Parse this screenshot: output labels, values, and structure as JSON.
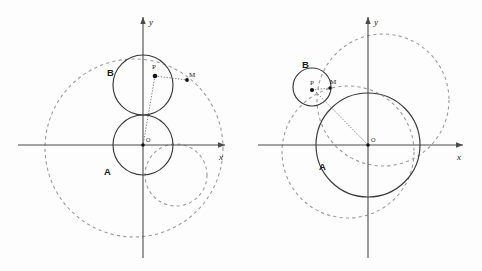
{
  "figure": {
    "background_color": "#fdfdfd",
    "solid_stroke_color": "#3a3a3a",
    "dashed_stroke_color": "#9b9b9b",
    "axis_color": "#4a4a4a",
    "point_color": "#111111"
  },
  "panels": [
    {
      "id": "left",
      "name": "left-diagram",
      "origin": {
        "x": 143,
        "y": 145,
        "label": "O"
      },
      "axes": {
        "x_label": "x",
        "y_label": "y",
        "x_start": 18,
        "x_end": 228,
        "y_top": 14,
        "y_bottom": 258
      },
      "labels": {
        "circle_a": "A",
        "circle_b": "B",
        "point_p": "P",
        "point_m": "M",
        "origin": "O"
      },
      "circles": [
        {
          "name": "circle-A",
          "style": "solid",
          "cx": 143,
          "cy": 145,
          "r": 30
        },
        {
          "name": "circle-B",
          "style": "solid",
          "cx": 143,
          "cy": 85,
          "r": 30
        },
        {
          "name": "dashed-outer",
          "style": "dashed",
          "cx": 134,
          "cy": 148,
          "r": 89
        },
        {
          "name": "dashed-inner-right",
          "style": "dashed",
          "cx": 176,
          "cy": 175,
          "r": 31
        }
      ],
      "points": [
        {
          "name": "point-P",
          "label": "P",
          "x": 155,
          "y": 76,
          "label_dx": 0,
          "label_dy": -5
        },
        {
          "name": "point-M",
          "label": "M",
          "x": 187,
          "y": 80,
          "label_dx": 3,
          "label_dy": -2
        },
        {
          "name": "point-O",
          "label": "O",
          "x": 143,
          "y": 145,
          "label_dx": 3,
          "label_dy": -3
        }
      ],
      "segments": [
        {
          "name": "segment-PM",
          "x1": 155,
          "y1": 76,
          "x2": 187,
          "y2": 80
        },
        {
          "name": "segment-PO",
          "x1": 155,
          "y1": 76,
          "x2": 143,
          "y2": 145
        }
      ],
      "label_positions": {
        "A": {
          "x": 107,
          "y": 172
        },
        "B": {
          "x": 113,
          "y": 73
        }
      }
    },
    {
      "id": "right",
      "name": "right-diagram",
      "origin": {
        "x": 368,
        "y": 145,
        "label": "O"
      },
      "axes": {
        "x_label": "x",
        "y_label": "y",
        "x_start": 258,
        "x_end": 466,
        "y_top": 14,
        "y_bottom": 258
      },
      "labels": {
        "circle_a": "A",
        "circle_b": "B",
        "point_p": "P",
        "point_m": "M",
        "origin": "O"
      },
      "circles": [
        {
          "name": "circle-A",
          "style": "solid",
          "cx": 368,
          "cy": 145,
          "r": 52
        },
        {
          "name": "circle-B",
          "style": "solid",
          "cx": 312,
          "cy": 87,
          "r": 19
        },
        {
          "name": "dashed-upper-right",
          "style": "dashed",
          "cx": 383,
          "cy": 100,
          "r": 66
        },
        {
          "name": "dashed-lower-left",
          "style": "dashed",
          "cx": 348,
          "cy": 152,
          "r": 66
        }
      ],
      "points": [
        {
          "name": "point-P",
          "label": "P",
          "x": 312,
          "y": 90,
          "label_dx": 0,
          "label_dy": -4
        },
        {
          "name": "point-M",
          "label": "M",
          "x": 330,
          "y": 88,
          "label_dx": 2,
          "label_dy": -3
        },
        {
          "name": "point-O",
          "label": "O",
          "x": 368,
          "y": 145,
          "label_dx": 3,
          "label_dy": -3
        }
      ],
      "segments": [
        {
          "name": "segment-PM",
          "x1": 312,
          "y1": 90,
          "x2": 330,
          "y2": 88
        },
        {
          "name": "segment-PO",
          "x1": 318,
          "y1": 94,
          "x2": 368,
          "y2": 145
        }
      ],
      "label_positions": {
        "A": {
          "x": 322,
          "y": 166
        },
        "B": {
          "x": 305,
          "y": 65
        }
      }
    }
  ]
}
